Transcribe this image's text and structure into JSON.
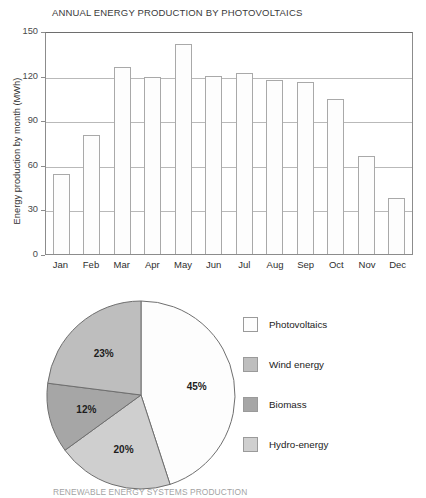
{
  "chart_data": [
    {
      "type": "bar",
      "title": "ANNUAL ENERGY PRODUCTION BY PHOTOVOLTAICS",
      "xlabel": "",
      "ylabel": "Energy production by month  (MWh)",
      "categories": [
        "Jan",
        "Feb",
        "Mar",
        "Apr",
        "May",
        "Jun",
        "Jul",
        "Aug",
        "Sep",
        "Oct",
        "Nov",
        "Dec"
      ],
      "values": [
        54,
        80,
        126,
        119,
        141,
        120,
        122,
        117,
        116,
        104,
        66,
        38
      ],
      "ylim": [
        0,
        150
      ],
      "yticks": [
        0,
        30,
        60,
        90,
        120,
        150
      ],
      "grid": true,
      "legend": "none",
      "bar_fill": "#fdfdfd",
      "bar_stroke": "#a9a9a9"
    },
    {
      "type": "pie",
      "title": "RENEWABLE ENERGY SYSTEMS PRODUCTION",
      "labels": [
        "Photovoltaics",
        "Hydro-energy",
        "Biomass",
        "Wind energy"
      ],
      "values": [
        45,
        20,
        12,
        23
      ],
      "value_labels": [
        "45%",
        "20%",
        "12%",
        "23%"
      ],
      "colors": [
        "#fdfdfd",
        "#cfcfcf",
        "#a6a6a6",
        "#bebebe"
      ],
      "legend_position": "right",
      "legend_order": [
        "Photovoltaics",
        "Wind energy",
        "Biomass",
        "Hydro-energy"
      ],
      "legend_colors": [
        "#fdfdfd",
        "#bebebe",
        "#a6a6a6",
        "#cfcfcf"
      ]
    }
  ],
  "bar_chart": {
    "title": "ANNUAL ENERGY PRODUCTION BY PHOTOVOLTAICS",
    "ylabel": "Energy production by month  (MWh)",
    "yticks": [
      "150",
      "120",
      "90",
      "60",
      "30",
      "0"
    ],
    "months": [
      "Jan",
      "Feb",
      "Mar",
      "Apr",
      "May",
      "Jun",
      "Jul",
      "Aug",
      "Sep",
      "Oct",
      "Nov",
      "Dec"
    ]
  },
  "pie_chart": {
    "title": "RENEWABLE ENERGY SYSTEMS PRODUCTION",
    "slices": [
      {
        "label": "45%",
        "value": 45
      },
      {
        "label": "20%",
        "value": 20
      },
      {
        "label": "12%",
        "value": 12
      },
      {
        "label": "23%",
        "value": 23
      }
    ],
    "legend": [
      {
        "label": "Photovoltaics",
        "color": "#fdfdfd"
      },
      {
        "label": "Wind energy",
        "color": "#bebebe"
      },
      {
        "label": "Biomass",
        "color": "#a6a6a6"
      },
      {
        "label": "Hydro-energy",
        "color": "#cfcfcf"
      }
    ]
  }
}
